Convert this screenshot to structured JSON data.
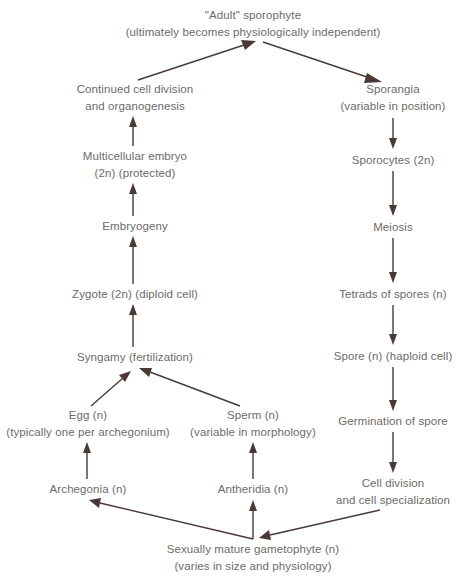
{
  "diagram": {
    "colors": {
      "text": "#6e6a68",
      "arrow": "#4a3a36",
      "background": "#ffffff"
    },
    "nodes": {
      "adult_sporophyte": {
        "line1": "\"Adult\" sporophyte",
        "line2": "(ultimately becomes physiologically independent)"
      },
      "continued_division": {
        "line1": "Continued cell division",
        "line2": "and organogenesis"
      },
      "sporangia": {
        "line1": "Sporangia",
        "line2": "(variable in position)"
      },
      "multicellular_embryo": {
        "line1": "Multicellular embryo",
        "line2": "(2n) (protected)"
      },
      "sporocytes": {
        "line1": "Sporocytes (2n)"
      },
      "embryogeny": {
        "line1": "Embryogeny"
      },
      "meiosis": {
        "line1": "Meiosis"
      },
      "zygote": {
        "line1": "Zygote (2n) (diploid cell)"
      },
      "tetrads": {
        "line1": "Tetrads of spores (n)"
      },
      "syngamy": {
        "line1": "Syngamy (fertilization)"
      },
      "spore": {
        "line1": "Spore (n) (haploid cell)"
      },
      "egg": {
        "line1": "Egg (n)",
        "line2": "(typically one per archegonium)"
      },
      "sperm": {
        "line1": "Sperm (n)",
        "line2": "(variable in morphology)"
      },
      "germination": {
        "line1": "Germination of spore"
      },
      "archegonia": {
        "line1": "Archegonia (n)"
      },
      "antheridia": {
        "line1": "Antheridia (n)"
      },
      "cell_division": {
        "line1": "Cell division",
        "line2": "and cell specialization"
      },
      "gametophyte": {
        "line1": "Sexually mature gametophyte (n)",
        "line2": "(varies in size and physiology)"
      }
    },
    "edges": [
      [
        "continued_division",
        "adult_sporophyte"
      ],
      [
        "adult_sporophyte",
        "sporangia"
      ],
      [
        "multicellular_embryo",
        "continued_division"
      ],
      [
        "sporangia",
        "sporocytes"
      ],
      [
        "embryogeny",
        "multicellular_embryo"
      ],
      [
        "sporocytes",
        "meiosis"
      ],
      [
        "zygote",
        "embryogeny"
      ],
      [
        "meiosis",
        "tetrads"
      ],
      [
        "syngamy",
        "zygote"
      ],
      [
        "tetrads",
        "spore"
      ],
      [
        "egg",
        "syngamy"
      ],
      [
        "sperm",
        "syngamy"
      ],
      [
        "spore",
        "germination"
      ],
      [
        "archegonia",
        "egg"
      ],
      [
        "antheridia",
        "sperm"
      ],
      [
        "germination",
        "cell_division"
      ],
      [
        "gametophyte",
        "archegonia"
      ],
      [
        "gametophyte",
        "antheridia"
      ],
      [
        "cell_division",
        "gametophyte"
      ]
    ]
  }
}
